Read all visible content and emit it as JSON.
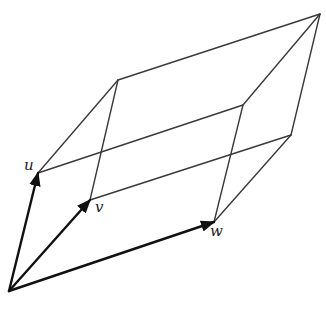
{
  "diagram": {
    "title": "",
    "colors": {
      "edge": "#3a3a3a",
      "vector": "#111111",
      "background": "#ffffff"
    },
    "vertices": {
      "O": [
        9,
        291
      ],
      "u": [
        38,
        173
      ],
      "v": [
        90,
        200
      ],
      "w": [
        214,
        222
      ],
      "uv": [
        118,
        80
      ],
      "uw": [
        243,
        105
      ],
      "vw": [
        291,
        135
      ],
      "uvw": [
        320,
        14
      ]
    },
    "vectors": [
      {
        "name": "u",
        "label": "u",
        "from": "O",
        "to": "u"
      },
      {
        "name": "v",
        "label": "v",
        "from": "O",
        "to": "v"
      },
      {
        "name": "w",
        "label": "w",
        "from": "O",
        "to": "w"
      }
    ],
    "edges": [
      [
        "u",
        "uv"
      ],
      [
        "u",
        "uw"
      ],
      [
        "v",
        "uv"
      ],
      [
        "v",
        "vw"
      ],
      [
        "w",
        "uw"
      ],
      [
        "w",
        "vw"
      ],
      [
        "uv",
        "uvw"
      ],
      [
        "uw",
        "uvw"
      ],
      [
        "vw",
        "uvw"
      ]
    ],
    "labels": [
      {
        "text": "u",
        "x": 24,
        "y": 158
      },
      {
        "text": "v",
        "x": 95,
        "y": 200
      },
      {
        "text": "w",
        "x": 210,
        "y": 224
      }
    ]
  }
}
